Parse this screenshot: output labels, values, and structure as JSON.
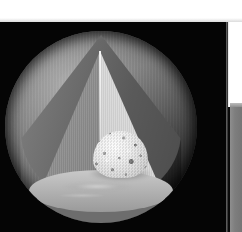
{
  "page": {
    "background_color": "#ffffff"
  },
  "caption": {
    "clipped_text": "•••   •",
    "note": "caption clipped above viewport"
  },
  "figure": {
    "name": "sphere-octant-cutaway",
    "background_color": "#050505",
    "layers": [
      {
        "name": "outer-surface",
        "label": "Outer surface",
        "color": "#757575"
      },
      {
        "name": "shell-rim",
        "label": "Shell rim",
        "color": "#6d6d6d"
      },
      {
        "name": "interior-wall-left",
        "label": "Interior wall (shaded)",
        "color": "#969696"
      },
      {
        "name": "interior-wall-right",
        "label": "Interior wall (lit)",
        "color": "#e3e3e3"
      },
      {
        "name": "floor-plane",
        "label": "Equatorial cut plane",
        "color": "#b4b4b4"
      },
      {
        "name": "inner-core",
        "label": "Inner core",
        "color": "#ececec"
      }
    ],
    "lighting": {
      "key_direction": "upper-left",
      "specular_highlight": "lower-center"
    }
  },
  "side_panel": {
    "name": "right-edge-panel",
    "color": "#7e7e7e",
    "top_color": "#bdbdbd"
  }
}
